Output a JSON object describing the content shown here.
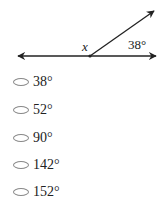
{
  "figure": {
    "vertex_label": "x",
    "angle_label": "38°",
    "colors": {
      "line": "#222222"
    }
  },
  "options": [
    {
      "label": "38°"
    },
    {
      "label": "52°"
    },
    {
      "label": "90°"
    },
    {
      "label": "142°"
    },
    {
      "label": "152°"
    }
  ]
}
